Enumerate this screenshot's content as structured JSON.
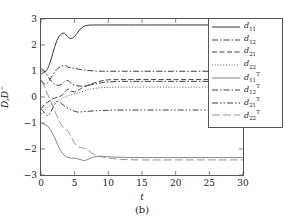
{
  "chart_data": {
    "type": "line",
    "title": "",
    "caption": "(b)",
    "xlabel": "t",
    "ylabel": "D,D",
    "ylabel_sup": "~",
    "xlim": [
      0,
      30
    ],
    "ylim": [
      -3,
      3
    ],
    "xticks": [
      0,
      5,
      10,
      15,
      20,
      25,
      30
    ],
    "yticks": [
      3,
      2,
      1,
      0,
      -1,
      -2,
      -3
    ],
    "grid": false,
    "legend_position": "top-right",
    "series": [
      {
        "name": "d11",
        "label_base": "d",
        "label_sub": "11",
        "label_sup": "",
        "style": "solid",
        "color": "#1a1a1a",
        "x": [
          0,
          0.5,
          1,
          1.5,
          2,
          2.5,
          3,
          3.5,
          4,
          4.5,
          5,
          5.5,
          6,
          6.5,
          7,
          7.5,
          8,
          9,
          10,
          12,
          15,
          20,
          25,
          30
        ],
        "y": [
          0.9,
          0.95,
          1.1,
          1.45,
          1.9,
          2.25,
          2.42,
          2.45,
          2.3,
          2.25,
          2.33,
          2.5,
          2.65,
          2.73,
          2.76,
          2.77,
          2.77,
          2.77,
          2.77,
          2.77,
          2.77,
          2.77,
          2.77,
          2.77
        ]
      },
      {
        "name": "d12",
        "label_base": "d",
        "label_sub": "12",
        "label_sup": "",
        "style": "dashdot",
        "color": "#2a2a2a",
        "x": [
          0,
          0.5,
          1,
          1.5,
          2,
          2.5,
          3,
          3.5,
          4,
          4.5,
          5,
          6,
          7,
          8,
          9,
          10,
          12,
          15,
          20,
          25,
          30
        ],
        "y": [
          0.65,
          0.5,
          0.55,
          0.75,
          0.95,
          1.1,
          1.18,
          1.22,
          1.15,
          1.12,
          1.1,
          1.05,
          1.02,
          1.0,
          0.99,
          0.99,
          0.99,
          0.99,
          0.99,
          0.99,
          0.99
        ]
      },
      {
        "name": "d21",
        "label_base": "d",
        "label_sub": "21",
        "label_sup": "",
        "style": "dashed",
        "color": "#2a2a2a",
        "x": [
          0,
          0.5,
          1,
          1.5,
          2,
          2.5,
          3,
          3.5,
          4,
          4.5,
          5,
          5.5,
          6,
          7,
          8,
          9,
          10,
          12,
          15,
          20,
          25,
          30
        ],
        "y": [
          -0.45,
          -0.3,
          -0.2,
          -0.1,
          -0.05,
          0.0,
          0.05,
          0.18,
          0.3,
          0.22,
          0.2,
          0.25,
          0.33,
          0.45,
          0.55,
          0.62,
          0.66,
          0.67,
          0.67,
          0.67,
          0.67,
          0.67
        ]
      },
      {
        "name": "d22",
        "label_base": "d",
        "label_sub": "22",
        "label_sup": "",
        "style": "dotted",
        "color": "#4a4a4a",
        "x": [
          0,
          0.5,
          1,
          1.5,
          2,
          2.5,
          3,
          3.5,
          4,
          5,
          6,
          7,
          8,
          9,
          10,
          12,
          15,
          20,
          25,
          30
        ],
        "y": [
          -0.65,
          -0.55,
          -0.4,
          -0.3,
          -0.22,
          -0.15,
          -0.08,
          0.0,
          0.05,
          0.12,
          0.2,
          0.28,
          0.33,
          0.36,
          0.37,
          0.38,
          0.38,
          0.38,
          0.38,
          0.38
        ]
      },
      {
        "name": "d11_T",
        "label_base": "d",
        "label_sub": "11",
        "label_sup": "T",
        "style": "solid-gray",
        "color": "#777777",
        "x": [
          0,
          0.5,
          1,
          1.5,
          2,
          2.5,
          3,
          3.5,
          4,
          4.5,
          5,
          5.5,
          6,
          6.5,
          7,
          7.5,
          8,
          9,
          10,
          12,
          15,
          20,
          25,
          30
        ],
        "y": [
          -1.0,
          -1.05,
          -1.12,
          -1.3,
          -1.55,
          -1.85,
          -2.1,
          -2.25,
          -2.32,
          -2.35,
          -2.35,
          -2.38,
          -2.42,
          -2.44,
          -2.4,
          -2.34,
          -2.3,
          -2.28,
          -2.3,
          -2.32,
          -2.33,
          -2.33,
          -2.33,
          -2.33
        ]
      },
      {
        "name": "d12_T",
        "label_base": "d",
        "label_sub": "12",
        "label_sup": "T",
        "style": "dashdot2",
        "color": "#2a2a2a",
        "x": [
          0,
          0.5,
          1,
          1.5,
          2,
          2.5,
          3,
          3.5,
          4,
          4.5,
          5,
          6,
          7,
          8,
          9,
          10,
          12,
          15,
          20,
          25,
          30
        ],
        "y": [
          1.1,
          1.0,
          0.8,
          0.62,
          0.5,
          0.45,
          0.48,
          0.6,
          0.63,
          0.52,
          0.45,
          0.42,
          0.45,
          0.5,
          0.55,
          0.58,
          0.6,
          0.6,
          0.6,
          0.6,
          0.6
        ]
      },
      {
        "name": "d21_T",
        "label_base": "d",
        "label_sub": "21",
        "label_sup": "T",
        "style": "dashdotdot",
        "color": "#2a2a2a",
        "x": [
          0,
          0.5,
          1,
          1.5,
          2,
          2.5,
          3,
          3.5,
          4,
          4.5,
          5,
          5.5,
          6,
          7,
          8,
          9,
          10,
          12,
          15,
          20,
          25,
          30
        ],
        "y": [
          -0.45,
          -0.6,
          -0.72,
          -0.55,
          -0.3,
          -0.18,
          -0.25,
          -0.35,
          -0.42,
          -0.5,
          -0.55,
          -0.58,
          -0.57,
          -0.55,
          -0.53,
          -0.52,
          -0.51,
          -0.5,
          -0.5,
          -0.5,
          -0.5,
          -0.5
        ]
      },
      {
        "name": "d22_T",
        "label_base": "d",
        "label_sub": "22",
        "label_sup": "T",
        "style": "longdash",
        "color": "#8a8a8a",
        "x": [
          0,
          0.5,
          1,
          1.5,
          2,
          2.5,
          3,
          3.5,
          4,
          4.5,
          5,
          5.5,
          6,
          6.5,
          7,
          7.5,
          8,
          8.5,
          9,
          10,
          12,
          15,
          20,
          25,
          30
        ],
        "y": [
          0.62,
          0.4,
          0.1,
          -0.2,
          -0.5,
          -0.8,
          -1.05,
          -1.25,
          -1.3,
          -1.55,
          -1.78,
          -1.9,
          -1.95,
          -1.97,
          -2.05,
          -2.15,
          -2.22,
          -2.27,
          -2.3,
          -2.35,
          -2.4,
          -2.42,
          -2.42,
          -2.42,
          -2.42
        ]
      }
    ]
  }
}
